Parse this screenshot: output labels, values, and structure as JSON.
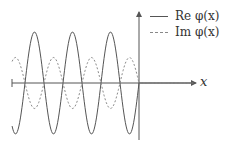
{
  "chart_data": {
    "type": "line",
    "title": "",
    "xlabel": "x",
    "ylabel": "",
    "grid": false,
    "legend_position": "upper right",
    "legend": [
      "Re φ(x)",
      "Im φ(x)"
    ],
    "series": [
      {
        "name": "Re φ(x)",
        "style": "solid",
        "description": "sinusoidal oscillation for x<0 (amplitude 1), then exponential decay from peak for x>0",
        "x": [
          -3.5,
          -3.25,
          -3.0,
          -2.75,
          -2.5,
          -2.25,
          -2.0,
          -1.75,
          -1.5,
          -1.25,
          -1.0,
          -0.75,
          -0.5,
          -0.25,
          0,
          0.25,
          0.5,
          1.0,
          1.5
        ],
        "values": [
          0,
          1,
          0,
          -1,
          0,
          1,
          0,
          -1,
          0,
          1,
          0,
          -1,
          0,
          0.9,
          1,
          0.45,
          0.22,
          0.05,
          0.01
        ]
      },
      {
        "name": "Im φ(x)",
        "style": "dashed",
        "description": "oscillation opposite in phase with smaller amplitude (0.5) for x<0, then negative exponential decay for x>0",
        "x": [
          -3.5,
          -3.25,
          -3.0,
          -2.75,
          -2.5,
          -2.25,
          -2.0,
          -1.75,
          -1.5,
          -1.25,
          -1.0,
          -0.75,
          -0.5,
          -0.25,
          0,
          0.25,
          0.5,
          1.0,
          1.5
        ],
        "values": [
          0,
          -0.5,
          0,
          0.5,
          0,
          -0.5,
          0,
          0.5,
          0,
          -0.5,
          0,
          0.5,
          0,
          -0.45,
          -0.45,
          -0.25,
          -0.12,
          -0.03,
          -0.01
        ]
      }
    ],
    "xlim": [
      -3.5,
      1.6
    ],
    "ylim": [
      -1.05,
      1.05
    ]
  },
  "legend": {
    "items": [
      {
        "label": "Re φ(x)",
        "style": "solid"
      },
      {
        "label": "Im φ(x)",
        "style": "dashed"
      }
    ]
  },
  "axes": {
    "x_label": "x"
  },
  "colors": {
    "re_line": "#555555",
    "im_line": "#8a8a8a",
    "axis": "#555555"
  }
}
